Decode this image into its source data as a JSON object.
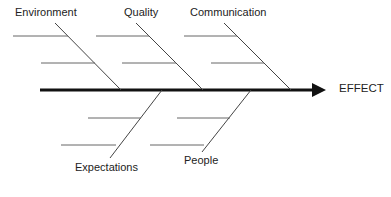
{
  "diagram": {
    "type": "fishbone",
    "effect_label": "EFFECT",
    "categories": {
      "top": [
        {
          "label": "Environment",
          "ribs": 2
        },
        {
          "label": "Quality",
          "ribs": 2
        },
        {
          "label": "Communication",
          "ribs": 2
        }
      ],
      "bottom": [
        {
          "label": "Expectations",
          "ribs": 2
        },
        {
          "label": "People",
          "ribs": 2
        }
      ]
    },
    "colors": {
      "spine": "#111111",
      "bones": "#444444",
      "ribs": "#666666",
      "text": "#222222"
    }
  }
}
